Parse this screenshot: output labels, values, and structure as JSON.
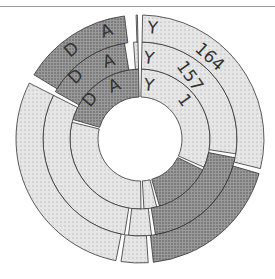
{
  "diagram": {
    "title": "",
    "center": [
      140,
      139
    ],
    "hole_radius": 42,
    "colors": {
      "dark": "#8c8c8c",
      "light": "#d9d9d9",
      "stroke": "#333333",
      "gap": "#ffffff"
    },
    "rings": [
      {
        "name": "day-1",
        "label": "DAY 1",
        "letters": [
          "D",
          "A",
          "Y",
          "1"
        ],
        "r_inner": 42,
        "r_outer": 70,
        "segments": [
          {
            "from": 0,
            "to": 115,
            "shade": "light"
          },
          {
            "from": 115,
            "to": 165,
            "shade": "dark"
          },
          {
            "from": 165,
            "to": 178,
            "shade": "light"
          },
          {
            "from": 178,
            "to": 285,
            "shade": "light"
          },
          {
            "from": 285,
            "to": 360,
            "shade": "dark"
          }
        ]
      },
      {
        "name": "day-157",
        "label": "DAY 157",
        "letters": [
          "D",
          "A",
          "Y",
          "157"
        ],
        "r_inner": 70,
        "r_outer": 97,
        "segments": [
          {
            "from": 0,
            "to": 100,
            "shade": "light"
          },
          {
            "from": 100,
            "to": 172,
            "shade": "dark"
          },
          {
            "from": 172,
            "to": 188,
            "shade": "light"
          },
          {
            "from": 188,
            "to": 298,
            "shade": "light"
          },
          {
            "from": 298,
            "to": 352,
            "shade": "dark"
          },
          {
            "from": 355,
            "to": 360,
            "shade": "light"
          }
        ]
      },
      {
        "name": "day-164",
        "label": "DAY 164",
        "letters": [
          "D",
          "A",
          "Y",
          "164"
        ],
        "r_inner": 97,
        "r_outer": 124,
        "segments": [
          {
            "from": 0,
            "to": 105,
            "shade": "light"
          },
          {
            "from": 105,
            "to": 175,
            "shade": "dark"
          },
          {
            "from": 175,
            "to": 190,
            "shade": "light"
          },
          {
            "from": 190,
            "to": 298,
            "shade": "light"
          },
          {
            "from": 300,
            "to": 354,
            "shade": "dark"
          },
          {
            "from": 357,
            "to": 360,
            "shade": "light"
          }
        ]
      }
    ],
    "text": {
      "d": "D",
      "a": "A",
      "y": "Y",
      "n1": "1",
      "n157": "157",
      "n164": "164"
    }
  }
}
